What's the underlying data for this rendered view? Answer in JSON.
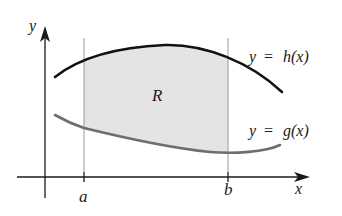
{
  "figure": {
    "axes": {
      "x_label": "x",
      "y_label": "y"
    },
    "ticks": {
      "a_label": "a",
      "b_label": "b"
    },
    "region": {
      "label": "R",
      "fill_color": "#e4e4e4"
    },
    "curves": {
      "upper": {
        "label_lhs": "y",
        "label_eq": "=",
        "label_rhs": "h(x)",
        "color": "#111111"
      },
      "lower": {
        "label_lhs": "y",
        "label_eq": "=",
        "label_rhs": "g(x)",
        "color": "#6e6e6e"
      }
    },
    "colors": {
      "axis": "#1a1a1a",
      "boundary_lines": "#9a9a9a",
      "background": "#ffffff"
    }
  }
}
